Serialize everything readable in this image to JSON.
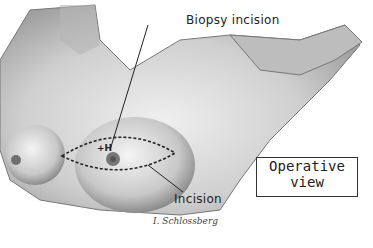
{
  "figure": {
    "type": "medical-illustration"
  },
  "labels": {
    "biopsy_incision": "Biopsy incision",
    "incision": "Incision",
    "operative_view_line1": "Operative",
    "operative_view_line2": "view"
  },
  "signature": "I. Schlossberg",
  "colors": {
    "background": "#ffffff",
    "skin_shade": "#c9c9c9",
    "line": "#222222"
  }
}
